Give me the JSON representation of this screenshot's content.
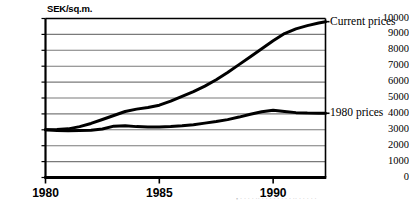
{
  "chart_data": {
    "type": "line",
    "title": "",
    "xlabel": "",
    "ylabel": "SEK/sq.m.",
    "ylim": [
      0,
      10000
    ],
    "xlim": [
      1980,
      1992.3
    ],
    "grid": true,
    "legend_position": "right-of-plot",
    "y_ticks": [
      "10000",
      "9000",
      "8000",
      "7000",
      "6000",
      "5000",
      "4000",
      "3000",
      "2000",
      "1000",
      "0"
    ],
    "y_tick_values": [
      10000,
      9000,
      8000,
      7000,
      6000,
      5000,
      4000,
      3000,
      2000,
      1000,
      0
    ],
    "x_ticks": [
      "1980",
      "1985",
      "1990"
    ],
    "x_tick_values": [
      1980,
      1985,
      1990
    ],
    "series": [
      {
        "name": "Current prices",
        "color": "#000000",
        "x": [
          1980,
          1980.5,
          1981,
          1981.5,
          1982,
          1982.5,
          1983,
          1983.5,
          1984,
          1984.5,
          1985,
          1985.5,
          1986,
          1986.5,
          1987,
          1987.5,
          1988,
          1988.5,
          1989,
          1989.5,
          1990,
          1990.5,
          1991,
          1991.5,
          1992,
          1992.3
        ],
        "values": [
          3000,
          3020,
          3060,
          3200,
          3400,
          3650,
          3900,
          4150,
          4300,
          4400,
          4550,
          4800,
          5100,
          5400,
          5750,
          6150,
          6600,
          7100,
          7600,
          8100,
          8600,
          9050,
          9350,
          9550,
          9720,
          9800
        ]
      },
      {
        "name": "1980 prices",
        "color": "#000000",
        "x": [
          1980,
          1980.5,
          1981,
          1981.5,
          1982,
          1982.5,
          1983,
          1983.5,
          1984,
          1984.5,
          1985,
          1985.5,
          1986,
          1986.5,
          1987,
          1987.5,
          1988,
          1988.5,
          1989,
          1989.5,
          1990,
          1990.5,
          1991,
          1991.5,
          1992,
          1992.3
        ],
        "values": [
          3000,
          2960,
          2940,
          2950,
          2970,
          3050,
          3230,
          3260,
          3200,
          3180,
          3180,
          3200,
          3250,
          3320,
          3420,
          3520,
          3640,
          3800,
          3980,
          4130,
          4230,
          4150,
          4080,
          4050,
          4040,
          4040
        ]
      }
    ],
    "annotations": []
  },
  "legend": {
    "current_prices_label": "Current prices",
    "prices_1980_label": "1980 prices"
  },
  "footnote": {
    "text": "• · · · · ·· · · · · · · · · ·· · · · · ·"
  },
  "colors": {
    "line": "#000000",
    "grid": "#7a7a7a",
    "frame": "#000000",
    "background": "#ffffff"
  }
}
